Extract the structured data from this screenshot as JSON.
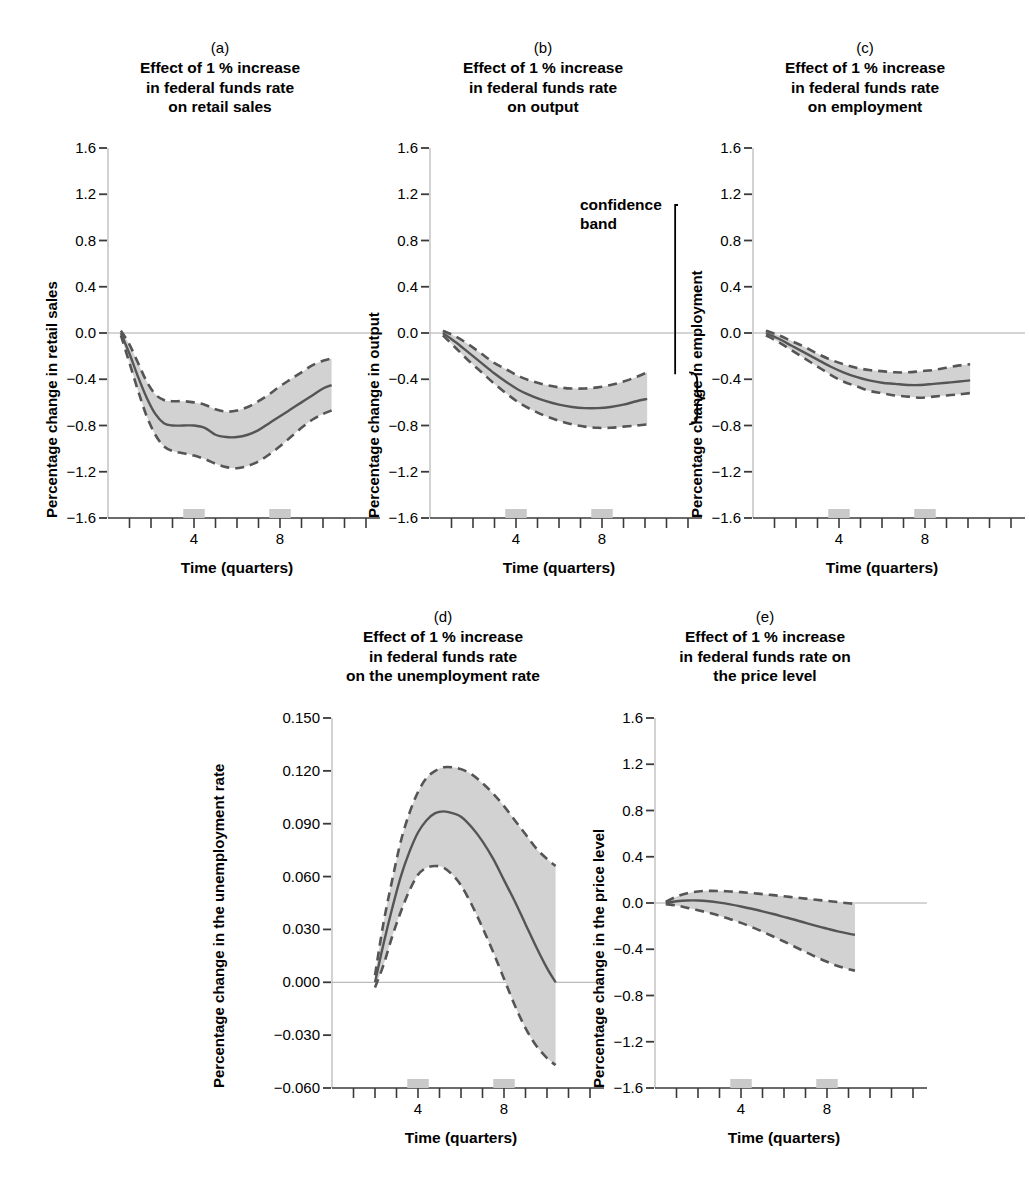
{
  "figure": {
    "background": "#ffffff",
    "line_color": "#555555",
    "band_fill": "#d2d2d2",
    "axis_color": "#b5b5b5",
    "tick_color": "#3a3a3a",
    "zero_line_color": "#aaaaaa",
    "xaxis_label": "Time (quarters)",
    "xtick_labels": [
      "4",
      "8"
    ]
  },
  "annotation": {
    "line1": "confidence",
    "line2": "band"
  },
  "chart_data": [
    {
      "id": "a",
      "type": "line",
      "letter": "(a)",
      "title_lines": [
        "Effect of 1 % increase",
        "in federal funds rate",
        "on retail sales"
      ],
      "title": "Effect of 1 % increase in federal funds rate on retail sales",
      "xlabel": "Time (quarters)",
      "ylabel": "Percentage change in retail sales",
      "ylim": [
        -1.6,
        1.6
      ],
      "yticks": [
        1.6,
        1.2,
        0.8,
        0.4,
        0.0,
        -0.4,
        -0.8,
        -1.2,
        -1.6
      ],
      "ytick_labels": [
        "1.6",
        "1.2",
        "0.8",
        "0.4",
        "0.0",
        "−0.4",
        "−0.8",
        "−1.2",
        "−1.6"
      ],
      "xlim": [
        0,
        12
      ],
      "xticks": [
        1,
        2,
        3,
        4,
        5,
        6,
        7,
        8,
        9,
        10,
        11,
        12
      ],
      "xtick_labels": {
        "4": "4",
        "8": "8"
      },
      "grid": false,
      "legend": "none",
      "x": [
        0.6,
        1.0,
        1.4,
        1.8,
        2.2,
        2.6,
        3.0,
        3.5,
        4.0,
        4.5,
        5.0,
        5.5,
        6.0,
        6.5,
        7.0,
        7.5,
        8.0,
        8.5,
        9.0,
        9.5,
        10.0,
        10.4
      ],
      "series": [
        {
          "name": "point estimate",
          "values": [
            0.0,
            -0.18,
            -0.38,
            -0.56,
            -0.7,
            -0.78,
            -0.8,
            -0.8,
            -0.8,
            -0.82,
            -0.88,
            -0.9,
            -0.9,
            -0.88,
            -0.84,
            -0.78,
            -0.72,
            -0.66,
            -0.6,
            -0.54,
            -0.48,
            -0.45
          ]
        },
        {
          "name": "upper confidence bound",
          "values": [
            0.02,
            -0.1,
            -0.26,
            -0.42,
            -0.53,
            -0.58,
            -0.59,
            -0.59,
            -0.6,
            -0.62,
            -0.66,
            -0.68,
            -0.67,
            -0.64,
            -0.59,
            -0.53,
            -0.46,
            -0.4,
            -0.34,
            -0.28,
            -0.24,
            -0.22
          ]
        },
        {
          "name": "lower confidence bound",
          "values": [
            -0.02,
            -0.26,
            -0.5,
            -0.72,
            -0.88,
            -0.98,
            -1.02,
            -1.04,
            -1.06,
            -1.09,
            -1.13,
            -1.16,
            -1.17,
            -1.15,
            -1.11,
            -1.05,
            -0.98,
            -0.9,
            -0.82,
            -0.75,
            -0.7,
            -0.67
          ]
        }
      ]
    },
    {
      "id": "b",
      "type": "line",
      "letter": "(b)",
      "title_lines": [
        "Effect of 1 % increase",
        "in federal funds rate",
        "on output"
      ],
      "title": "Effect of 1 % increase in federal funds rate on output",
      "xlabel": "Time (quarters)",
      "ylabel": "Percentage change in output",
      "ylim": [
        -1.6,
        1.6
      ],
      "yticks": [
        1.6,
        1.2,
        0.8,
        0.4,
        0.0,
        -0.4,
        -0.8,
        -1.2,
        -1.6
      ],
      "ytick_labels": [
        "1.6",
        "1.2",
        "0.8",
        "0.4",
        "0.0",
        "−0.4",
        "−0.8",
        "−1.2",
        "−1.6"
      ],
      "xlim": [
        0,
        12
      ],
      "xticks": [
        1,
        2,
        3,
        4,
        5,
        6,
        7,
        8,
        9,
        10,
        11,
        12
      ],
      "xtick_labels": {
        "4": "4",
        "8": "8"
      },
      "grid": false,
      "legend": "none",
      "annotation": "confidence band",
      "x": [
        0.6,
        1.2,
        1.8,
        2.4,
        3.0,
        3.6,
        4.2,
        4.8,
        5.4,
        6.0,
        6.6,
        7.2,
        7.8,
        8.4,
        9.0,
        9.6,
        10.1
      ],
      "series": [
        {
          "name": "point estimate",
          "values": [
            0.0,
            -0.08,
            -0.17,
            -0.26,
            -0.35,
            -0.43,
            -0.5,
            -0.55,
            -0.59,
            -0.62,
            -0.64,
            -0.65,
            -0.65,
            -0.64,
            -0.62,
            -0.59,
            -0.57
          ]
        },
        {
          "name": "upper confidence bound",
          "values": [
            0.02,
            -0.03,
            -0.1,
            -0.18,
            -0.26,
            -0.32,
            -0.38,
            -0.42,
            -0.45,
            -0.47,
            -0.48,
            -0.48,
            -0.47,
            -0.45,
            -0.42,
            -0.38,
            -0.34
          ]
        },
        {
          "name": "lower confidence bound",
          "values": [
            -0.02,
            -0.13,
            -0.24,
            -0.34,
            -0.44,
            -0.53,
            -0.61,
            -0.67,
            -0.72,
            -0.76,
            -0.79,
            -0.81,
            -0.82,
            -0.82,
            -0.81,
            -0.8,
            -0.79
          ]
        }
      ]
    },
    {
      "id": "c",
      "type": "line",
      "letter": "(c)",
      "title_lines": [
        "Effect of 1 % increase",
        "in federal funds rate",
        "on employment"
      ],
      "title": "Effect of 1 % increase in federal funds rate on employment",
      "xlabel": "Time (quarters)",
      "ylabel": "Percentage change in employment",
      "ylim": [
        -1.6,
        1.6
      ],
      "yticks": [
        1.6,
        1.2,
        0.8,
        0.4,
        0.0,
        -0.4,
        -0.8,
        -1.2,
        -1.6
      ],
      "ytick_labels": [
        "1.6",
        "1.2",
        "0.8",
        "0.4",
        "0.0",
        "−0.4",
        "−0.8",
        "−1.2",
        "−1.6"
      ],
      "xlim": [
        0,
        12
      ],
      "xticks": [
        1,
        2,
        3,
        4,
        5,
        6,
        7,
        8,
        9,
        10,
        11,
        12
      ],
      "xtick_labels": {
        "4": "4",
        "8": "8"
      },
      "grid": false,
      "legend": "none",
      "x": [
        0.6,
        1.2,
        1.8,
        2.4,
        3.0,
        3.6,
        4.2,
        4.8,
        5.4,
        6.0,
        6.6,
        7.2,
        7.8,
        8.4,
        9.0,
        9.6,
        10.1
      ],
      "series": [
        {
          "name": "point estimate",
          "values": [
            0.0,
            -0.05,
            -0.11,
            -0.17,
            -0.23,
            -0.29,
            -0.34,
            -0.38,
            -0.41,
            -0.43,
            -0.44,
            -0.45,
            -0.45,
            -0.44,
            -0.43,
            -0.42,
            -0.41
          ]
        },
        {
          "name": "upper confidence bound",
          "values": [
            0.02,
            -0.02,
            -0.07,
            -0.12,
            -0.18,
            -0.23,
            -0.27,
            -0.3,
            -0.32,
            -0.33,
            -0.34,
            -0.34,
            -0.33,
            -0.32,
            -0.3,
            -0.28,
            -0.27
          ]
        },
        {
          "name": "lower confidence bound",
          "values": [
            -0.02,
            -0.08,
            -0.15,
            -0.22,
            -0.29,
            -0.36,
            -0.42,
            -0.46,
            -0.5,
            -0.52,
            -0.54,
            -0.55,
            -0.56,
            -0.55,
            -0.54,
            -0.53,
            -0.52
          ]
        }
      ]
    },
    {
      "id": "d",
      "type": "line",
      "letter": "(d)",
      "title_lines": [
        "Effect of 1 % increase",
        "in federal funds rate",
        "on the unemployment rate"
      ],
      "title": "Effect of 1 % increase in federal funds rate on the unemployment rate",
      "xlabel": "Time (quarters)",
      "ylabel": "Percentage change in the unemployment rate",
      "ylim": [
        -0.06,
        0.15
      ],
      "yticks": [
        0.15,
        0.12,
        0.09,
        0.06,
        0.03,
        0.0,
        -0.03,
        -0.06
      ],
      "ytick_labels": [
        "0.150",
        "0.120",
        "0.090",
        "0.060",
        "0.030",
        "0.000",
        "−0.030",
        "−0.060"
      ],
      "xlim": [
        0,
        12
      ],
      "xticks": [
        1,
        2,
        3,
        4,
        5,
        6,
        7,
        8,
        9,
        10,
        11,
        12
      ],
      "xtick_labels": {
        "4": "4",
        "8": "8"
      },
      "grid": false,
      "legend": "none",
      "x": [
        2.0,
        2.4,
        2.8,
        3.2,
        3.6,
        4.0,
        4.4,
        4.8,
        5.2,
        5.6,
        6.0,
        6.5,
        7.0,
        7.5,
        8.0,
        8.5,
        9.0,
        9.5,
        10.0,
        10.4
      ],
      "series": [
        {
          "name": "point estimate",
          "values": [
            0.0,
            0.022,
            0.042,
            0.06,
            0.074,
            0.085,
            0.092,
            0.096,
            0.097,
            0.096,
            0.094,
            0.088,
            0.08,
            0.07,
            0.058,
            0.046,
            0.033,
            0.02,
            0.008,
            0.0
          ]
        },
        {
          "name": "upper confidence bound",
          "values": [
            0.004,
            0.034,
            0.058,
            0.08,
            0.096,
            0.108,
            0.116,
            0.12,
            0.122,
            0.122,
            0.121,
            0.118,
            0.113,
            0.107,
            0.1,
            0.092,
            0.084,
            0.076,
            0.07,
            0.066
          ]
        },
        {
          "name": "lower confidence bound",
          "values": [
            -0.003,
            0.01,
            0.026,
            0.04,
            0.052,
            0.061,
            0.065,
            0.066,
            0.065,
            0.061,
            0.055,
            0.044,
            0.031,
            0.017,
            0.002,
            -0.013,
            -0.026,
            -0.036,
            -0.043,
            -0.047
          ]
        }
      ]
    },
    {
      "id": "e",
      "type": "line",
      "letter": "(e)",
      "title_lines": [
        "Effect of 1 % increase",
        "in federal funds rate on",
        "the price level"
      ],
      "title": "Effect of 1 % increase in federal funds rate on the price level",
      "xlabel": "Time (quarters)",
      "ylabel": "Percentage change in the price level",
      "ylim": [
        -1.6,
        1.6
      ],
      "yticks": [
        1.6,
        1.2,
        0.8,
        0.4,
        0.0,
        -0.4,
        -0.8,
        -1.2,
        -1.6
      ],
      "ytick_labels": [
        "1.6",
        "1.2",
        "0.8",
        "0.4",
        "0.0",
        "−0.4",
        "−0.8",
        "−1.2",
        "−1.6"
      ],
      "xlim": [
        0,
        12
      ],
      "xticks": [
        1,
        2,
        3,
        4,
        5,
        6,
        7,
        8,
        9,
        10,
        11,
        12
      ],
      "xtick_labels": {
        "4": "4",
        "8": "8"
      },
      "grid": false,
      "legend": "none",
      "x": [
        0.5,
        1.0,
        1.5,
        2.0,
        2.5,
        3.0,
        3.5,
        4.0,
        4.5,
        5.0,
        5.5,
        6.0,
        6.5,
        7.0,
        7.5,
        8.0,
        8.5,
        9.0,
        9.3
      ],
      "series": [
        {
          "name": "point estimate",
          "values": [
            0.0,
            0.015,
            0.022,
            0.022,
            0.015,
            0.003,
            -0.012,
            -0.03,
            -0.05,
            -0.072,
            -0.095,
            -0.12,
            -0.145,
            -0.172,
            -0.198,
            -0.222,
            -0.245,
            -0.265,
            -0.275
          ]
        },
        {
          "name": "upper confidence bound",
          "values": [
            0.01,
            0.055,
            0.085,
            0.1,
            0.105,
            0.104,
            0.1,
            0.094,
            0.086,
            0.077,
            0.068,
            0.058,
            0.048,
            0.038,
            0.028,
            0.018,
            0.008,
            -0.002,
            -0.008
          ]
        },
        {
          "name": "lower confidence bound",
          "values": [
            -0.01,
            -0.022,
            -0.042,
            -0.062,
            -0.085,
            -0.11,
            -0.14,
            -0.172,
            -0.208,
            -0.248,
            -0.29,
            -0.333,
            -0.378,
            -0.423,
            -0.468,
            -0.508,
            -0.545,
            -0.572,
            -0.585
          ]
        }
      ]
    }
  ]
}
